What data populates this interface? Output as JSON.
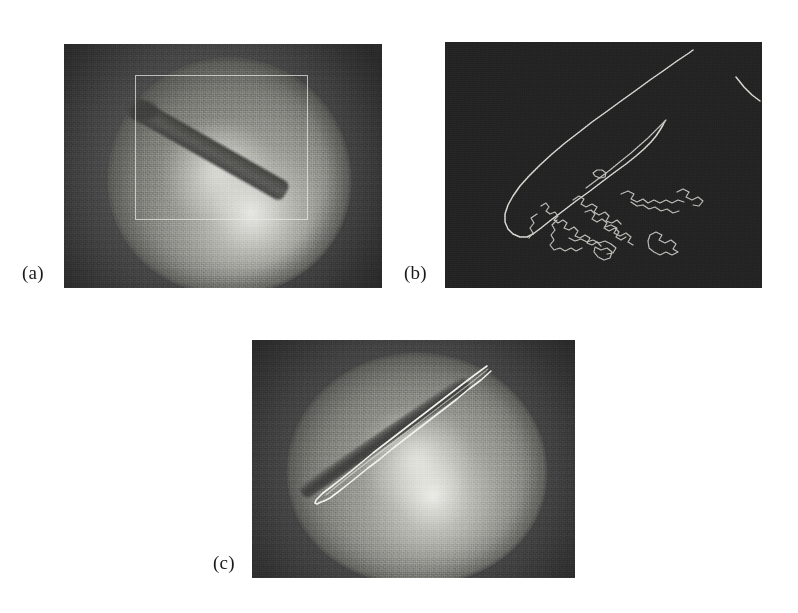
{
  "figure": {
    "background_color": "#ffffff",
    "width": 798,
    "height": 613,
    "layout": "three panels: two on top row, one centered on bottom row",
    "caption_style": "parenthesized lowercase letters at lower-left of each panel"
  },
  "panels": [
    {
      "id": "a",
      "label": "(a)",
      "role": "original-image",
      "description": "Grayscale endoscopic/fundus image: illuminated spherical tissue surface with a dark elongated surgical instrument shaft entering from the upper right, plus a white rectangular region-of-interest overlay",
      "frame": {
        "x": 64,
        "y": 44,
        "width": 318,
        "height": 244
      },
      "label_pos": {
        "x": 22,
        "y": 262
      },
      "colors": {
        "border_dark": "#4b4b4b",
        "tissue_light": "#e8e8e4",
        "tissue_mid": "#9a9a95",
        "tissue_dark": "#636360",
        "instrument": "#3c3c3a",
        "roi_outline": "#ecece6"
      },
      "roi": {
        "x": 134,
        "y": 75,
        "width": 171,
        "height": 143,
        "stroke": "#ecece6"
      }
    },
    {
      "id": "b",
      "label": "(b)",
      "role": "edge-detection-result",
      "description": "Binary/edge map on a near-black background: the long bright outline of the instrument shaft with a rounded tip at lower left, a short detached edge segment at the top-right corner, and a cluster of noisy fragmented contours in the lower-middle region",
      "frame": {
        "x": 445,
        "y": 42,
        "width": 317,
        "height": 246
      },
      "label_pos": {
        "x": 404,
        "y": 262
      },
      "colors": {
        "background": "#232323",
        "edge_stroke": "#d8d8d2"
      }
    },
    {
      "id": "c",
      "label": "(c)",
      "role": "tracking-result",
      "description": "Same grayscale scene as panel (a) with the detected instrument boundary highlighted as a bright white contour tracing the shaft and its tip",
      "frame": {
        "x": 252,
        "y": 340,
        "width": 323,
        "height": 238
      },
      "label_pos": {
        "x": 213,
        "y": 552
      },
      "colors": {
        "border_dark": "#4a4a4a",
        "tissue_light": "#ebebe7",
        "tissue_mid": "#9e9e99",
        "tissue_dark": "#656562",
        "instrument": "#4a4a48",
        "track_outline": "#f2f2ec"
      }
    }
  ]
}
